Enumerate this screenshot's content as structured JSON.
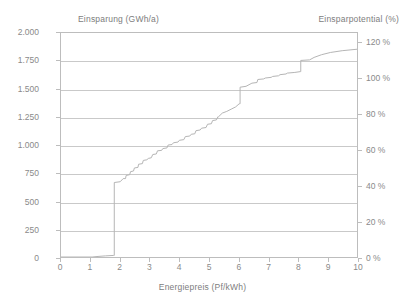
{
  "chart_data": {
    "type": "line",
    "title": "",
    "xlabel": "Energiepreis (Pf/kWh)",
    "ylabel": "Einsparung (GWh/a)",
    "ylabel_right": "Einsparpotential  (%)",
    "xlim": [
      0,
      10
    ],
    "ylim": [
      0,
      2000
    ],
    "ylim_right": [
      0,
      125.7
    ],
    "grid": true,
    "legend": null,
    "xticks": [
      "0",
      "1",
      "2",
      "3",
      "4",
      "5",
      "6",
      "7",
      "8",
      "9",
      "10"
    ],
    "xtick_values": [
      0,
      1,
      2,
      3,
      4,
      5,
      6,
      7,
      8,
      9,
      10
    ],
    "yticks": [
      "0",
      "250",
      "500",
      "750",
      "1.000",
      "1.250",
      "1.500",
      "1.750",
      "2.000"
    ],
    "ytick_values": [
      0,
      250,
      500,
      750,
      1000,
      1250,
      1500,
      1750,
      2000
    ],
    "yticks_right": [
      "0 %",
      "20 %",
      "40 %",
      "60 %",
      "80 %",
      "100 %",
      "120 %"
    ],
    "ytick_values_right": [
      0,
      20,
      40,
      60,
      80,
      100,
      120
    ],
    "series": [
      {
        "name": "Kumulierte Einsparung",
        "color": "#b5b5b5",
        "x": [
          0.0,
          1.05,
          1.25,
          1.5,
          1.78,
          1.8,
          1.8,
          2.0,
          2.1,
          2.18,
          2.2,
          2.32,
          2.35,
          2.45,
          2.48,
          2.6,
          2.62,
          2.75,
          2.78,
          2.9,
          2.95,
          3.05,
          3.1,
          3.22,
          3.26,
          3.4,
          3.44,
          3.58,
          3.62,
          3.75,
          3.8,
          3.95,
          4.0,
          4.15,
          4.2,
          4.35,
          4.4,
          4.52,
          4.56,
          4.7,
          4.75,
          4.9,
          4.95,
          5.08,
          5.12,
          5.25,
          5.3,
          5.32,
          5.45,
          5.6,
          5.75,
          5.9,
          6.02,
          6.05,
          6.05,
          6.25,
          6.45,
          6.62,
          6.65,
          6.85,
          6.9,
          7.1,
          7.15,
          7.35,
          7.4,
          7.6,
          7.65,
          7.9,
          8.08,
          8.1,
          8.1,
          8.4,
          8.55,
          8.8,
          9.1,
          9.5,
          10.0
        ],
        "y": [
          0,
          0,
          5,
          10,
          14,
          14,
          665,
          672,
          700,
          700,
          728,
          735,
          762,
          768,
          795,
          800,
          828,
          834,
          862,
          868,
          880,
          886,
          915,
          920,
          948,
          952,
          968,
          974,
          1000,
          1004,
          1020,
          1026,
          1042,
          1048,
          1075,
          1080,
          1096,
          1100,
          1128,
          1134,
          1150,
          1156,
          1185,
          1190,
          1218,
          1224,
          1252,
          1252,
          1285,
          1300,
          1320,
          1340,
          1368,
          1368,
          1516,
          1524,
          1552,
          1558,
          1585,
          1590,
          1598,
          1604,
          1612,
          1618,
          1628,
          1634,
          1642,
          1648,
          1655,
          1655,
          1755,
          1760,
          1782,
          1806,
          1826,
          1842,
          1855
        ]
      }
    ]
  },
  "chart": {
    "left_axis_title": "Einsparung (GWh/a)",
    "right_axis_title": "Einsparpotential  (%)",
    "x_axis_title": "Energiepreis (Pf/kWh)"
  },
  "colors": {
    "line": "#b5b5b5",
    "grid": "#c9c9c9",
    "frame": "#bdbdbd",
    "text": "#8a8a8a",
    "background": "#ffffff"
  }
}
